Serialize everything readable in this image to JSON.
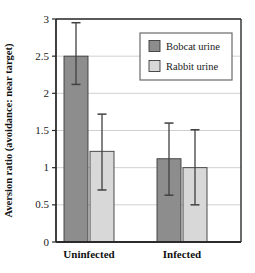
{
  "chart_data": {
    "type": "bar",
    "title": "",
    "subtitle": "",
    "xlabel": "",
    "ylabel": "Aversion ratio (avoidance: near target)",
    "categories": [
      "Uninfected",
      "Infected"
    ],
    "ylim": [
      0,
      3
    ],
    "yticks": [
      "0",
      "0.5",
      "1",
      "1.5",
      "2",
      "2.5",
      "3"
    ],
    "ytick_values": [
      0,
      0.5,
      1,
      1.5,
      2,
      2.5,
      3
    ],
    "grid": true,
    "grid_axis": "y",
    "legend_position": "top-right",
    "error_bars": "asymmetric",
    "series": [
      {
        "name": "Bobcat urine",
        "color": "#8d8d8d",
        "values": [
          2.5,
          1.12
        ],
        "error_low": [
          2.12,
          0.63
        ],
        "error_high": [
          2.95,
          1.6
        ]
      },
      {
        "name": "Rabbit urine",
        "color": "#d8d8d8",
        "values": [
          1.22,
          1.0
        ],
        "error_low": [
          0.7,
          0.5
        ],
        "error_high": [
          1.72,
          1.51
        ]
      }
    ]
  },
  "legend": {
    "items": [
      {
        "label": "Bobcat urine",
        "swatch": "#8d8d8d"
      },
      {
        "label": "Rabbit urine",
        "swatch": "#d8d8d8"
      }
    ]
  },
  "colors": {
    "bobcat": "#8d8d8d",
    "rabbit": "#d8d8d8",
    "axis": "#2b2b2b",
    "grid": "#d0d0d0",
    "error": "#404040",
    "background": "#ffffff"
  },
  "geometry": {
    "plot_left": 56,
    "plot_right": 241,
    "plot_top": 19,
    "plot_bottom": 242,
    "bar_width": 24,
    "group_centers": [
      89,
      182
    ],
    "bar_gap": 2
  }
}
